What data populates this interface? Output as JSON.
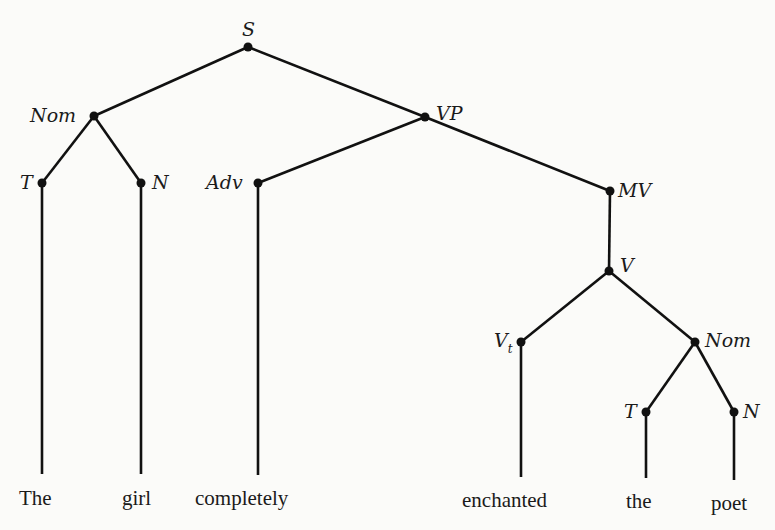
{
  "diagram": {
    "type": "syntax-tree",
    "nodes": {
      "S": {
        "label": "S"
      },
      "Nom1": {
        "label": "Nom"
      },
      "VP": {
        "label": "VP"
      },
      "T1": {
        "label": "T"
      },
      "N1": {
        "label": "N"
      },
      "Adv": {
        "label": "Adv"
      },
      "MV": {
        "label": "MV"
      },
      "V": {
        "label": "V"
      },
      "Vt": {
        "label": "V",
        "subscript": "t"
      },
      "Nom2": {
        "label": "Nom"
      },
      "T2": {
        "label": "T"
      },
      "N2": {
        "label": "N"
      }
    },
    "leaves": {
      "w1": "The",
      "w2": "girl",
      "w3": "completely",
      "w4": "enchanted",
      "w5": "the",
      "w6": "poet"
    },
    "edges": [
      [
        "S",
        "Nom1"
      ],
      [
        "S",
        "VP"
      ],
      [
        "Nom1",
        "T1"
      ],
      [
        "Nom1",
        "N1"
      ],
      [
        "VP",
        "Adv"
      ],
      [
        "VP",
        "MV"
      ],
      [
        "MV",
        "V"
      ],
      [
        "V",
        "Vt"
      ],
      [
        "V",
        "Nom2"
      ],
      [
        "Nom2",
        "T2"
      ],
      [
        "Nom2",
        "N2"
      ],
      [
        "T1",
        "The"
      ],
      [
        "N1",
        "girl"
      ],
      [
        "Adv",
        "completely"
      ],
      [
        "Vt",
        "enchanted"
      ],
      [
        "T2",
        "the"
      ],
      [
        "N2",
        "poet"
      ]
    ]
  }
}
